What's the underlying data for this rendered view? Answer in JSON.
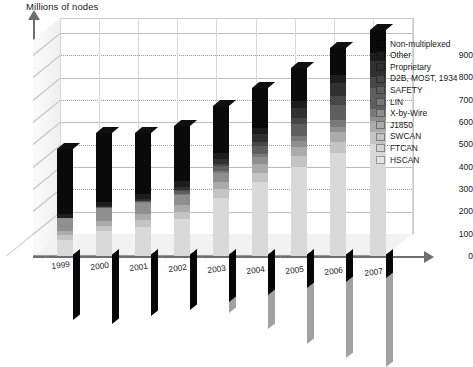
{
  "chart_data": {
    "type": "bar",
    "subtype": "stacked-3d-column",
    "title": "",
    "ylabel": "Millions of nodes",
    "xlabel": "",
    "ylim": [
      0,
      950
    ],
    "ytick_values": [
      0,
      100,
      200,
      300,
      400,
      500,
      600,
      700,
      800,
      900
    ],
    "ytick_labels": [
      "0",
      "100",
      "200",
      "300",
      "400",
      "500",
      "600",
      "700",
      "800",
      "900"
    ],
    "grid": true,
    "legend_position": "right",
    "categories": [
      "1999",
      "2000",
      "2001",
      "2002",
      "2003",
      "2004",
      "2005",
      "2006",
      "2007"
    ],
    "series": [
      {
        "name": "HSCAN",
        "color": "#d9d9d9",
        "values": [
          70,
          110,
          130,
          165,
          260,
          330,
          400,
          460,
          500
        ]
      },
      {
        "name": "FTCAN",
        "color": "#c4c4c4",
        "values": [
          22,
          26,
          30,
          34,
          38,
          42,
          46,
          50,
          54
        ]
      },
      {
        "name": "SWCAN",
        "color": "#ababab",
        "values": [
          18,
          22,
          26,
          30,
          34,
          38,
          42,
          46,
          50
        ]
      },
      {
        "name": "J1850",
        "color": "#8f8f8f",
        "values": [
          60,
          58,
          52,
          46,
          40,
          34,
          28,
          22,
          16
        ]
      },
      {
        "name": "X-by-Wire",
        "color": "#7a7a7a",
        "values": [
          0,
          0,
          2,
          4,
          8,
          14,
          22,
          30,
          40
        ]
      },
      {
        "name": "LIN",
        "color": "#5e5e5e",
        "values": [
          0,
          2,
          6,
          12,
          22,
          36,
          52,
          70,
          90
        ]
      },
      {
        "name": "SAFETY",
        "color": "#474747",
        "values": [
          0,
          0,
          2,
          5,
          10,
          18,
          28,
          40,
          52
        ]
      },
      {
        "name": "D2B, MOST, 1934",
        "color": "#303030",
        "values": [
          2,
          4,
          8,
          14,
          22,
          32,
          44,
          58,
          72
        ]
      },
      {
        "name": "Proprietary",
        "color": "#1d1d1d",
        "values": [
          18,
          20,
          22,
          24,
          26,
          28,
          30,
          32,
          34
        ]
      },
      {
        "name": "Non-multiplexed",
        "color": "#0a0a0a",
        "values": [
          290,
          308,
          272,
          246,
          210,
          178,
          148,
          122,
          102
        ]
      }
    ],
    "totals": [
      480,
      550,
      550,
      580,
      670,
      750,
      840,
      930,
      1010
    ]
  },
  "legend": {
    "items": [
      {
        "label": "Non-multiplexed",
        "color": "#0a0a0a"
      },
      {
        "label": "Other",
        "color": "#1d1d1d"
      },
      {
        "label": "Proprietary",
        "color": "#303030"
      },
      {
        "label": "D2B, MOST, 1934",
        "color": "#474747"
      },
      {
        "label": "SAFETY",
        "color": "#5e5e5e"
      },
      {
        "label": "LIN",
        "color": "#7a7a7a"
      },
      {
        "label": "X-by-Wire",
        "color": "#8f8f8f"
      },
      {
        "label": "J1850",
        "color": "#ababab"
      },
      {
        "label": "SWCAN",
        "color": "#c4c4c4"
      },
      {
        "label": "FTCAN",
        "color": "#d4d4d4"
      },
      {
        "label": "HSCAN",
        "color": "#e6e6e6"
      }
    ]
  },
  "axes": {
    "y_title": "Millions of nodes",
    "y_ticks": [
      "900",
      "800",
      "700",
      "600",
      "500",
      "400",
      "300",
      "200",
      "100",
      "0"
    ],
    "x_ticks": [
      "1999",
      "2000",
      "2001",
      "2002",
      "2003",
      "2004",
      "2005",
      "2006",
      "2007"
    ]
  },
  "footer": {
    "caption": ""
  }
}
